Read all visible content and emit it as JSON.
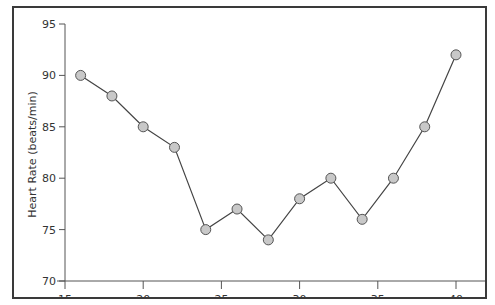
{
  "chart_data": {
    "type": "line",
    "title": "",
    "xlabel": "",
    "ylabel": "Heart Rate (beats/min)",
    "x": [
      16,
      18,
      20,
      22,
      24,
      26,
      28,
      30,
      32,
      34,
      36,
      38,
      40
    ],
    "series": [
      {
        "name": "Heart Rate",
        "values": [
          90,
          88,
          85,
          83,
          75,
          77,
          74,
          78,
          80,
          76,
          80,
          85,
          92
        ]
      }
    ],
    "xlim": [
      15,
      40
    ],
    "ylim": [
      70,
      95
    ],
    "x_ticks": [
      "15",
      "20",
      "25",
      "30",
      "35",
      "40"
    ],
    "y_ticks": [
      "70",
      "75",
      "80",
      "85",
      "90",
      "95"
    ],
    "grid": false,
    "legend": null,
    "marker_fill": "#c8c8c8",
    "marker_stroke": "#555555",
    "line_color": "#444444"
  }
}
